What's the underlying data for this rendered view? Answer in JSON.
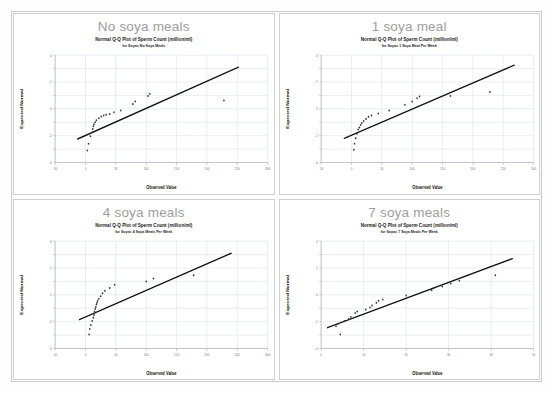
{
  "page": {
    "background_color": "#ffffff",
    "border_color": "#c9c9c9"
  },
  "panels": [
    {
      "id": "no-soya-meals",
      "heading": "No soya meals",
      "chart_index": 0
    },
    {
      "id": "one-soya-meal",
      "heading": "1 soya meal",
      "chart_index": 1
    },
    {
      "id": "four-soya-meals",
      "heading": "4 soya meals",
      "chart_index": 2
    },
    {
      "id": "seven-soya-meals",
      "heading": "7 soya meals",
      "chart_index": 3
    }
  ],
  "chart_data": [
    {
      "type": "scatter",
      "title": "Normal Q-Q Plot of Sperm Count (million/ml)",
      "subtitle": "for Soya= No Soya Meals",
      "xlabel": "Observed Value",
      "ylabel": "Expected Normal",
      "xlim": [
        -50,
        300
      ],
      "ylim": [
        -4,
        4
      ],
      "xticks": [
        -50,
        0,
        50,
        100,
        150,
        200,
        250,
        300
      ],
      "xticklabels": [
        "-50",
        "0",
        "50",
        "100",
        "150",
        "200",
        "250",
        "300"
      ],
      "yticks": [
        -4,
        -3,
        -2,
        -1,
        0,
        1,
        2,
        3,
        4
      ],
      "yticklabels": [
        "-4",
        "-3",
        "-2",
        "-1",
        "0",
        "1",
        "2",
        "3",
        "4"
      ],
      "grid": true,
      "legend": "none",
      "reference_line": {
        "x0": -13,
        "y0": -2.25,
        "x1": 252,
        "y1": 3.1
      },
      "points": [
        {
          "x": 3,
          "y": -3.1
        },
        {
          "x": 5,
          "y": -2.6
        },
        {
          "x": 8,
          "y": -2.05
        },
        {
          "x": 11,
          "y": -1.75
        },
        {
          "x": 12,
          "y": -1.5
        },
        {
          "x": 13,
          "y": -1.3
        },
        {
          "x": 14,
          "y": -1.15
        },
        {
          "x": 16,
          "y": -1.0
        },
        {
          "x": 18,
          "y": -0.85
        },
        {
          "x": 22,
          "y": -0.7
        },
        {
          "x": 26,
          "y": -0.58
        },
        {
          "x": 30,
          "y": -0.5
        },
        {
          "x": 34,
          "y": -0.44
        },
        {
          "x": 40,
          "y": -0.38
        },
        {
          "x": 47,
          "y": -0.25
        },
        {
          "x": 58,
          "y": -0.12
        },
        {
          "x": 78,
          "y": 0.35
        },
        {
          "x": 82,
          "y": 0.55
        },
        {
          "x": 103,
          "y": 0.95
        },
        {
          "x": 106,
          "y": 1.12
        },
        {
          "x": 228,
          "y": 0.62
        }
      ]
    },
    {
      "type": "scatter",
      "title": "Normal Q-Q Plot of Sperm Count (million/ml)",
      "subtitle": "for Soya= 1 Soya Meal Per Week",
      "xlabel": "Observed Value",
      "ylabel": "Expected Normal",
      "xlim": [
        -50,
        300
      ],
      "ylim": [
        -4,
        4
      ],
      "xticks": [
        -50,
        0,
        50,
        100,
        150,
        200,
        250,
        300
      ],
      "xticklabels": [
        "-50",
        "0",
        "50",
        "100",
        "150",
        "200",
        "250",
        "300"
      ],
      "yticks": [
        -4,
        -3,
        -2,
        -1,
        0,
        1,
        2,
        3,
        4
      ],
      "yticklabels": [
        "-4",
        "-3",
        "-2",
        "-1",
        "0",
        "1",
        "2",
        "3",
        "4"
      ],
      "grid": true,
      "legend": "none",
      "reference_line": {
        "x0": -12,
        "y0": -2.2,
        "x1": 268,
        "y1": 3.25
      },
      "points": [
        {
          "x": 4,
          "y": -3.05
        },
        {
          "x": 5,
          "y": -2.6
        },
        {
          "x": 7,
          "y": -2.2
        },
        {
          "x": 9,
          "y": -1.85
        },
        {
          "x": 11,
          "y": -1.55
        },
        {
          "x": 13,
          "y": -1.4
        },
        {
          "x": 15,
          "y": -1.2
        },
        {
          "x": 17,
          "y": -1.05
        },
        {
          "x": 20,
          "y": -0.9
        },
        {
          "x": 24,
          "y": -0.75
        },
        {
          "x": 28,
          "y": -0.6
        },
        {
          "x": 33,
          "y": -0.5
        },
        {
          "x": 44,
          "y": -0.35
        },
        {
          "x": 62,
          "y": -0.12
        },
        {
          "x": 88,
          "y": 0.3
        },
        {
          "x": 100,
          "y": 0.55
        },
        {
          "x": 108,
          "y": 0.78
        },
        {
          "x": 112,
          "y": 0.92
        },
        {
          "x": 163,
          "y": 0.95
        },
        {
          "x": 228,
          "y": 1.25
        }
      ]
    },
    {
      "type": "scatter",
      "title": "Normal Q-Q Plot of Sperm Count (million/ml)",
      "subtitle": "for Soya= 4 Soya Meals Per Week",
      "xlabel": "Observed Value",
      "ylabel": "Expected Normal",
      "xlim": [
        -50,
        300
      ],
      "ylim": [
        -4,
        4
      ],
      "xticks": [
        -50,
        0,
        50,
        100,
        150,
        200,
        250,
        300
      ],
      "xticklabels": [
        "-50",
        "0",
        "50",
        "100",
        "150",
        "200",
        "250",
        "300"
      ],
      "yticks": [
        -4,
        -3,
        -2,
        -1,
        0,
        1,
        2,
        3,
        4
      ],
      "yticklabels": [
        "-4",
        "-3",
        "-2",
        "-1",
        "0",
        "1",
        "2",
        "3",
        "4"
      ],
      "grid": true,
      "legend": "none",
      "reference_line": {
        "x0": -10,
        "y0": -1.85,
        "x1": 240,
        "y1": 3.1
      },
      "points": [
        {
          "x": 6,
          "y": -2.95
        },
        {
          "x": 7,
          "y": -2.55
        },
        {
          "x": 9,
          "y": -2.25
        },
        {
          "x": 11,
          "y": -1.95
        },
        {
          "x": 13,
          "y": -1.7
        },
        {
          "x": 14,
          "y": -1.5
        },
        {
          "x": 15,
          "y": -1.25
        },
        {
          "x": 16,
          "y": -1.05
        },
        {
          "x": 17,
          "y": -0.9
        },
        {
          "x": 18,
          "y": -0.72
        },
        {
          "x": 19,
          "y": -0.6
        },
        {
          "x": 20,
          "y": -0.45
        },
        {
          "x": 22,
          "y": -0.3
        },
        {
          "x": 25,
          "y": -0.1
        },
        {
          "x": 28,
          "y": 0.12
        },
        {
          "x": 32,
          "y": 0.3
        },
        {
          "x": 40,
          "y": 0.5
        },
        {
          "x": 48,
          "y": 0.75
        },
        {
          "x": 100,
          "y": 1.0
        },
        {
          "x": 112,
          "y": 1.22
        },
        {
          "x": 178,
          "y": 1.45
        }
      ]
    },
    {
      "type": "scatter",
      "title": "Normal Q-Q Plot of Sperm Count (million/ml)",
      "subtitle": "for Soya= 7 Soya Meals Per Week",
      "xlabel": "Observed Value",
      "ylabel": "Expected Normal",
      "xlim": [
        0,
        50
      ],
      "ylim": [
        -4,
        4
      ],
      "xticks": [
        0,
        10,
        20,
        30,
        40,
        50
      ],
      "xticklabels": [
        "0",
        "10",
        "20",
        "30",
        "40",
        "50"
      ],
      "yticks": [
        -4,
        -3,
        -2,
        -1,
        0,
        1,
        2,
        3,
        4
      ],
      "yticklabels": [
        "-4",
        "-3",
        "-2",
        "-1",
        "0",
        "1",
        "2",
        "3",
        "4"
      ],
      "grid": true,
      "legend": "none",
      "reference_line": {
        "x0": 1.5,
        "y0": -2.45,
        "x1": 45,
        "y1": 2.7
      },
      "points": [
        {
          "x": 4.5,
          "y": -2.95
        },
        {
          "x": 3.5,
          "y": -2.35
        },
        {
          "x": 4.0,
          "y": -2.15
        },
        {
          "x": 5.5,
          "y": -1.95
        },
        {
          "x": 6.5,
          "y": -1.8
        },
        {
          "x": 7.0,
          "y": -1.65
        },
        {
          "x": 8.0,
          "y": -1.35
        },
        {
          "x": 8.5,
          "y": -1.25
        },
        {
          "x": 10.5,
          "y": -1.1
        },
        {
          "x": 11.5,
          "y": -0.95
        },
        {
          "x": 12.0,
          "y": -0.8
        },
        {
          "x": 13.0,
          "y": -0.6
        },
        {
          "x": 13.5,
          "y": -0.45
        },
        {
          "x": 14.5,
          "y": -0.35
        },
        {
          "x": 20.0,
          "y": -0.05
        },
        {
          "x": 26.0,
          "y": 0.35
        },
        {
          "x": 26.5,
          "y": 0.5
        },
        {
          "x": 28.5,
          "y": 0.62
        },
        {
          "x": 30.5,
          "y": 0.85
        },
        {
          "x": 32.5,
          "y": 1.05
        },
        {
          "x": 41.0,
          "y": 1.45
        }
      ]
    }
  ]
}
